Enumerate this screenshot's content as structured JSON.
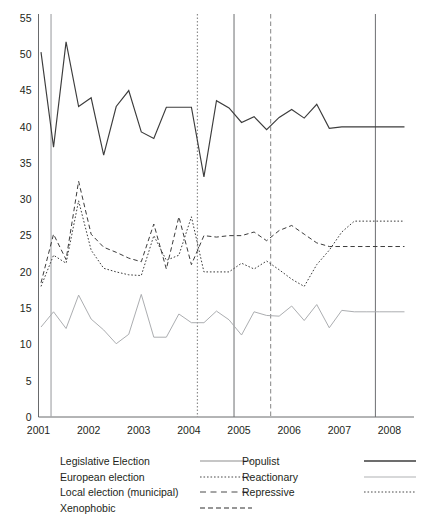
{
  "chart_data": {
    "type": "line",
    "title": "",
    "subtitle": "",
    "xlabel": "",
    "ylabel": "",
    "xlim": [
      2001.0,
      2008.45
    ],
    "ylim": [
      0,
      55
    ],
    "grid": false,
    "legend_position": "below-axes",
    "y_ticks": [
      0,
      5,
      10,
      15,
      20,
      25,
      30,
      35,
      40,
      45,
      50,
      55
    ],
    "y_tick_labels": [
      "0",
      "5",
      "10",
      "15",
      "20",
      "25",
      "30",
      "35",
      "40",
      "45",
      "50",
      "55"
    ],
    "x_ticks": [
      2001,
      2002,
      2003,
      2004,
      2005,
      2006,
      2007,
      2008
    ],
    "x_tick_labels": [
      "2001",
      "2002",
      "2003",
      "2004",
      "2005",
      "2006",
      "2007",
      "2008"
    ],
    "x": [
      2001.05,
      2001.3,
      2001.55,
      2001.8,
      2002.05,
      2002.3,
      2002.55,
      2002.8,
      2003.05,
      2003.3,
      2003.55,
      2003.8,
      2004.05,
      2004.3,
      2004.55,
      2004.8,
      2005.05,
      2005.3,
      2005.55,
      2005.8,
      2006.05,
      2006.3,
      2006.55,
      2006.8,
      2007.05,
      2007.3,
      2007.55,
      2007.8,
      2008.05,
      2008.3
    ],
    "series": [
      {
        "name": "Populist",
        "style": "solid",
        "color": "#3c3c3c",
        "width": 1.15,
        "values": [
          50.3,
          37.2,
          51.7,
          42.8,
          44.0,
          36.1,
          42.8,
          45.0,
          39.3,
          38.4,
          42.7,
          42.7,
          42.7,
          33.1,
          43.6,
          42.6,
          40.6,
          41.4,
          39.6,
          41.3,
          42.4,
          41.2,
          43.1,
          39.8,
          40.0,
          40.0,
          40.0,
          40.0,
          40.0,
          40.0
        ]
      },
      {
        "name": "Xenophobic",
        "style": "dashed",
        "color": "#3c3c3c",
        "width": 1.0,
        "values": [
          18.5,
          25.2,
          21.7,
          32.5,
          25.2,
          23.4,
          22.7,
          21.9,
          21.4,
          26.6,
          20.4,
          27.6,
          21.0,
          25.0,
          24.8,
          25.0,
          25.0,
          25.5,
          24.3,
          25.7,
          26.4,
          25.2,
          24.0,
          23.5,
          23.5,
          23.5,
          23.5,
          23.5,
          23.5,
          23.5
        ]
      },
      {
        "name": "Repressive",
        "style": "dotted",
        "color": "#3c3c3c",
        "width": 1.0,
        "values": [
          18.0,
          22.3,
          21.2,
          29.8,
          23.0,
          20.5,
          20.0,
          19.6,
          19.5,
          25.0,
          21.6,
          22.3,
          27.6,
          20.0,
          20.0,
          20.0,
          21.2,
          20.4,
          21.5,
          20.3,
          19.0,
          18.0,
          21.0,
          23.0,
          25.5,
          27.0,
          27.0,
          27.0,
          27.0,
          27.0
        ]
      },
      {
        "name": "Reactionary",
        "style": "solid",
        "color": "#a7a9ac",
        "width": 0.95,
        "values": [
          12.4,
          14.5,
          12.2,
          16.8,
          13.5,
          12.0,
          10.1,
          11.4,
          16.9,
          11.0,
          11.0,
          14.2,
          13.0,
          13.0,
          14.6,
          13.4,
          11.3,
          14.5,
          14.0,
          13.9,
          15.3,
          13.3,
          15.5,
          12.3,
          14.7,
          14.5,
          14.5,
          14.5,
          14.5,
          14.5
        ]
      }
    ],
    "event_lines": [
      {
        "name": "Legislative Election",
        "x": 2001.25,
        "style": "solid",
        "color": "#a7a9ac",
        "width": 1.2
      },
      {
        "name": "European election",
        "x": 2004.17,
        "style": "dotted",
        "color": "#8d8d8d",
        "width": 1.2
      },
      {
        "name": "Legislative Election",
        "x": 2004.9,
        "style": "solid",
        "color": "#6d6e71",
        "width": 1.0
      },
      {
        "name": "Local election (municipal)",
        "x": 2005.63,
        "style": "dashed",
        "color": "#9a9a9a",
        "width": 1.2
      },
      {
        "name": "Legislative Election",
        "x": 2007.72,
        "style": "solid",
        "color": "#6d6e71",
        "width": 1.0
      }
    ]
  },
  "legend": {
    "left_column": [
      {
        "label": "Legislative Election",
        "sample": "solid-gray"
      },
      {
        "label": "European election",
        "sample": "dotted"
      },
      {
        "label": "Local election (municipal)",
        "sample": "dashed-long"
      },
      {
        "label": "Xenophobic",
        "sample": "dashed"
      }
    ],
    "right_column": [
      {
        "label": "Populist",
        "sample": "solid-dark"
      },
      {
        "label": "Reactionary",
        "sample": "solid-light"
      },
      {
        "label": "Repressive",
        "sample": "dotted"
      }
    ]
  },
  "colors": {
    "populist": "#3c3c3c",
    "reactionary": "#a7a9ac",
    "xenophobic": "#3c3c3c",
    "repressive": "#3c3c3c",
    "axis": "#58595b",
    "background": "#ffffff"
  }
}
